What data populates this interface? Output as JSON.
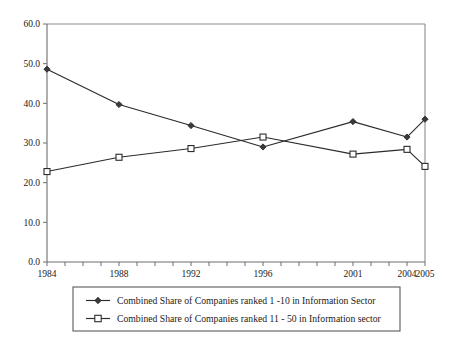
{
  "chart_data": {
    "type": "line",
    "title": "",
    "subtitle": "",
    "xlabel": "",
    "ylabel": "",
    "x": [
      1984,
      1988,
      1992,
      1996,
      2001,
      2004,
      2005
    ],
    "xlim": [
      1984,
      2005
    ],
    "ylim": [
      0.0,
      60.0
    ],
    "yticks": [
      "0.0",
      "10.0",
      "20.0",
      "30.0",
      "40.0",
      "50.0",
      "60.0"
    ],
    "ytick_values": [
      0,
      10,
      20,
      30,
      40,
      50,
      60
    ],
    "xticks": [
      "1984",
      "1988",
      "1992",
      "1996",
      "2001",
      "2004",
      "2005"
    ],
    "xtick_values": [
      1984,
      1988,
      1992,
      1996,
      2001,
      2004,
      2005
    ],
    "minor_x_ticks_every_year": true,
    "grid": false,
    "legend_position": "below-plot",
    "series": [
      {
        "name": "Combined Share of Companies ranked 1 -10 in Information Sector",
        "marker": "filled-diamond",
        "values": [
          48.6,
          39.7,
          34.4,
          29.0,
          35.4,
          31.5,
          36.0
        ]
      },
      {
        "name": "Combined Share of Companies ranked 11 - 50 in Information sector",
        "marker": "open-square",
        "values": [
          22.8,
          26.4,
          28.6,
          31.5,
          27.2,
          28.4,
          24.1
        ]
      }
    ]
  },
  "legend": {
    "entries": [
      {
        "label": "Combined Share of Companies ranked 1 -10 in Information Sector"
      },
      {
        "label": "Combined Share of Companies ranked 11 - 50 in Information sector"
      }
    ]
  },
  "colors": {
    "series_line": "#2b2b2b",
    "axis": "#6e6e6e",
    "frame": "#8c8c8c",
    "background": "#ffffff",
    "text": "#1a1a1a"
  }
}
